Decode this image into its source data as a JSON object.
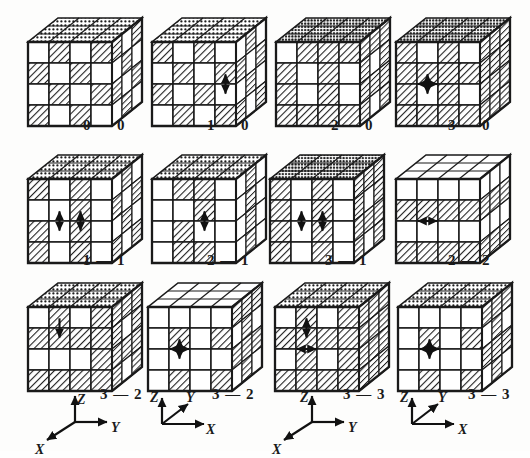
{
  "figure": {
    "type": "technical-illustration",
    "background_color": "#fdfdfc",
    "ink_color": "#1a1a1a",
    "hatch_color": "#2b2b2b",
    "blank_color": "#ffffff",
    "rows": 3,
    "columns": 4,
    "grid_order": 4
  },
  "cubes": [
    {
      "id": "cube-0-0",
      "label": "0 — 0",
      "label_left": 83,
      "label_top": 117,
      "x": 28,
      "y": 18,
      "front_pattern": [
        [
          0,
          1,
          0,
          1
        ],
        [
          1,
          0,
          1,
          0
        ],
        [
          0,
          1,
          0,
          1
        ],
        [
          1,
          0,
          1,
          0
        ]
      ],
      "top_style": "dotted",
      "side_pattern": [
        [
          1,
          0,
          1,
          0
        ],
        [
          0,
          1,
          0,
          1
        ],
        [
          1,
          0,
          1,
          0
        ],
        [
          0,
          1,
          0,
          1
        ]
      ],
      "arrows": []
    },
    {
      "id": "cube-1-0",
      "label": "1 — 0",
      "label_left": 207,
      "label_top": 117,
      "x": 152,
      "y": 18,
      "front_pattern": [
        [
          1,
          0,
          1,
          0
        ],
        [
          0,
          1,
          0,
          1
        ],
        [
          1,
          0,
          1,
          0
        ],
        [
          0,
          1,
          0,
          1
        ]
      ],
      "top_style": "dotted",
      "side_pattern": [
        [
          0,
          1,
          0,
          1
        ],
        [
          1,
          0,
          1,
          0
        ],
        [
          0,
          1,
          0,
          1
        ],
        [
          1,
          0,
          1,
          0
        ]
      ],
      "arrows": [
        {
          "col": 3,
          "row": 1,
          "dir": "vertical",
          "double": true
        }
      ]
    },
    {
      "id": "cube-2-0",
      "label": "2 — 0",
      "label_left": 331,
      "label_top": 117,
      "x": 276,
      "y": 18,
      "front_pattern": [
        [
          0,
          1,
          1,
          1
        ],
        [
          1,
          0,
          1,
          0
        ],
        [
          1,
          0,
          1,
          0
        ],
        [
          1,
          1,
          1,
          1
        ]
      ],
      "top_style": "dotted-dense",
      "side_pattern": [
        [
          1,
          1,
          1,
          1
        ],
        [
          1,
          0,
          1,
          0
        ],
        [
          1,
          1,
          1,
          1
        ],
        [
          1,
          0,
          1,
          0
        ]
      ],
      "arrows": []
    },
    {
      "id": "cube-3-0",
      "label": "3 — 0",
      "label_left": 448,
      "label_top": 117,
      "x": 396,
      "y": 18,
      "front_pattern": [
        [
          1,
          0,
          1,
          0
        ],
        [
          1,
          1,
          1,
          1
        ],
        [
          1,
          0,
          1,
          0
        ],
        [
          1,
          1,
          1,
          1
        ]
      ],
      "top_style": "dotted-dense",
      "side_pattern": [
        [
          1,
          1,
          1,
          1
        ],
        [
          1,
          1,
          1,
          1
        ],
        [
          1,
          1,
          1,
          1
        ],
        [
          1,
          1,
          1,
          1
        ]
      ],
      "arrows": [
        {
          "col": 1,
          "row": 1,
          "dir": "cross",
          "double": true
        }
      ]
    },
    {
      "id": "cube-1-1",
      "label": "1 — 1",
      "label_left": 83,
      "label_top": 252,
      "x": 28,
      "y": 155,
      "front_pattern": [
        [
          1,
          0,
          1,
          0
        ],
        [
          0,
          0,
          1,
          0
        ],
        [
          1,
          0,
          1,
          0
        ],
        [
          1,
          0,
          1,
          0
        ]
      ],
      "top_style": "dotted",
      "side_pattern": [
        [
          0,
          1,
          0,
          1
        ],
        [
          1,
          0,
          1,
          0
        ],
        [
          0,
          1,
          0,
          1
        ],
        [
          1,
          0,
          1,
          0
        ]
      ],
      "arrows": [
        {
          "col": 2,
          "row": 1,
          "dir": "vertical",
          "double": true
        },
        {
          "col": 1,
          "row": 1,
          "dir": "vertical",
          "double": true
        }
      ]
    },
    {
      "id": "cube-2-1",
      "label": "2 — 1",
      "label_left": 207,
      "label_top": 252,
      "x": 152,
      "y": 155,
      "front_pattern": [
        [
          0,
          1,
          1,
          0
        ],
        [
          0,
          0,
          1,
          0
        ],
        [
          0,
          1,
          0,
          0
        ],
        [
          0,
          1,
          1,
          0
        ]
      ],
      "top_style": "dotted",
      "side_pattern": [
        [
          0,
          1,
          0,
          1
        ],
        [
          0,
          1,
          0,
          1
        ],
        [
          0,
          1,
          0,
          1
        ],
        [
          0,
          1,
          0,
          1
        ]
      ],
      "arrows": [
        {
          "col": 2,
          "row": 1,
          "dir": "vertical",
          "double": true
        }
      ]
    },
    {
      "id": "cube-3-1",
      "label": "3 — 1",
      "label_left": 325,
      "label_top": 252,
      "x": 270,
      "y": 155,
      "front_pattern": [
        [
          1,
          0,
          1,
          0
        ],
        [
          1,
          0,
          1,
          0
        ],
        [
          1,
          0,
          1,
          0
        ],
        [
          1,
          0,
          1,
          0
        ]
      ],
      "top_style": "dotted-dense",
      "side_pattern": [
        [
          1,
          1,
          1,
          1
        ],
        [
          1,
          0,
          1,
          0
        ],
        [
          1,
          1,
          1,
          1
        ],
        [
          1,
          0,
          1,
          0
        ]
      ],
      "arrows": [
        {
          "col": 1,
          "row": 1,
          "dir": "vertical",
          "double": true
        },
        {
          "col": 2,
          "row": 1,
          "dir": "vertical",
          "double": true
        }
      ]
    },
    {
      "id": "cube-2-2",
      "label": "2 — 2",
      "label_left": 448,
      "label_top": 252,
      "x": 396,
      "y": 155,
      "front_pattern": [
        [
          0,
          0,
          0,
          0
        ],
        [
          1,
          1,
          1,
          1
        ],
        [
          0,
          0,
          0,
          0
        ],
        [
          1,
          1,
          1,
          1
        ]
      ],
      "top_style": "plain",
      "side_pattern": [
        [
          0,
          0,
          0,
          0
        ],
        [
          1,
          1,
          1,
          1
        ],
        [
          0,
          0,
          0,
          0
        ],
        [
          1,
          1,
          1,
          1
        ]
      ],
      "arrows": [
        {
          "col": 1,
          "row": 1,
          "dir": "horizontal",
          "double": true
        }
      ]
    },
    {
      "id": "cube-3-2-a",
      "label": "3 — 2",
      "label_left": 100,
      "label_top": 386,
      "x": 28,
      "y": 283,
      "front_pattern": [
        [
          0,
          1,
          0,
          1
        ],
        [
          1,
          1,
          1,
          1
        ],
        [
          0,
          0,
          0,
          1
        ],
        [
          1,
          1,
          1,
          1
        ]
      ],
      "top_style": "dotted",
      "side_pattern": [
        [
          1,
          1,
          1,
          1
        ],
        [
          1,
          0,
          1,
          0
        ],
        [
          1,
          1,
          1,
          1
        ],
        [
          1,
          0,
          1,
          0
        ]
      ],
      "arrows": [
        {
          "col": 1,
          "row": 0,
          "dir": "vertical-down",
          "double": false
        }
      ]
    },
    {
      "id": "cube-3-2-b",
      "label": "3 — 2",
      "label_left": 212,
      "label_top": 386,
      "x": 148,
      "y": 283,
      "front_pattern": [
        [
          0,
          0,
          0,
          0
        ],
        [
          0,
          1,
          0,
          1
        ],
        [
          0,
          0,
          0,
          0
        ],
        [
          0,
          1,
          0,
          1
        ]
      ],
      "top_style": "plain",
      "side_pattern": [
        [
          1,
          1,
          1,
          1
        ],
        [
          0,
          1,
          0,
          1
        ],
        [
          1,
          1,
          1,
          1
        ],
        [
          0,
          1,
          0,
          1
        ]
      ],
      "arrows": [
        {
          "col": 1,
          "row": 1,
          "dir": "cross",
          "double": true
        }
      ]
    },
    {
      "id": "cube-3-3-a",
      "label": "3 — 3",
      "label_left": 343,
      "label_top": 386,
      "x": 275,
      "y": 283,
      "front_pattern": [
        [
          0,
          1,
          0,
          1
        ],
        [
          1,
          1,
          1,
          1
        ],
        [
          0,
          1,
          0,
          1
        ],
        [
          1,
          1,
          1,
          1
        ]
      ],
      "top_style": "dotted",
      "side_pattern": [
        [
          1,
          1,
          1,
          1
        ],
        [
          1,
          1,
          1,
          1
        ],
        [
          1,
          1,
          1,
          1
        ],
        [
          1,
          1,
          1,
          1
        ]
      ],
      "arrows": [
        {
          "col": 1,
          "row": 1,
          "dir": "horizontal",
          "double": true
        },
        {
          "col": 1,
          "row": 0,
          "dir": "vertical",
          "double": true
        }
      ]
    },
    {
      "id": "cube-3-3-b",
      "label": "3 — 3",
      "label_left": 468,
      "label_top": 386,
      "x": 398,
      "y": 283,
      "front_pattern": [
        [
          0,
          0,
          0,
          0
        ],
        [
          0,
          1,
          0,
          1
        ],
        [
          0,
          0,
          0,
          0
        ],
        [
          0,
          1,
          0,
          1
        ]
      ],
      "top_style": "dotted",
      "side_pattern": [
        [
          1,
          1,
          1,
          1
        ],
        [
          0,
          1,
          0,
          1
        ],
        [
          1,
          1,
          1,
          1
        ],
        [
          0,
          1,
          0,
          1
        ]
      ],
      "arrows": [
        {
          "col": 1,
          "row": 1,
          "dir": "cross",
          "double": true
        }
      ]
    }
  ],
  "axes": [
    {
      "id": "axis-triad-1",
      "left": 35,
      "top": 390,
      "style": "z-up-y-right-x-downleft",
      "labels": {
        "z": "Z",
        "y": "Y",
        "x": "X"
      },
      "z_left": 42,
      "z_top": 2,
      "y_left": 76,
      "y_top": 30,
      "x_left": 0,
      "x_top": 52
    },
    {
      "id": "axis-triad-2",
      "left": 150,
      "top": 390,
      "style": "z-up-y-upright-x-right",
      "labels": {
        "z": "Z",
        "y": "Y",
        "x": "X"
      },
      "z_left": 0,
      "z_top": 0,
      "y_left": 36,
      "y_top": 0,
      "x_left": 56,
      "x_top": 32
    },
    {
      "id": "axis-triad-3",
      "left": 272,
      "top": 390,
      "style": "z-up-y-right-x-downleft",
      "labels": {
        "z": "Z",
        "y": "Y",
        "x": "X"
      },
      "z_left": 28,
      "z_top": 0,
      "y_left": 76,
      "y_top": 30,
      "x_left": 0,
      "x_top": 52
    },
    {
      "id": "axis-triad-4",
      "left": 400,
      "top": 390,
      "style": "z-up-y-upright-x-right",
      "labels": {
        "z": "Z",
        "y": "Y",
        "x": "X"
      },
      "z_left": 0,
      "z_top": 0,
      "y_left": 38,
      "y_top": 0,
      "x_left": 58,
      "x_top": 32
    }
  ]
}
